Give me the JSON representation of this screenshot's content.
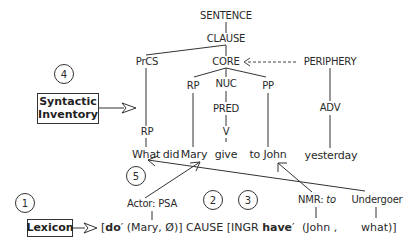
{
  "tree": {
    "sentence": "SENTENCE",
    "clause": "CLAUSE",
    "prcs": "PrCS",
    "core": "CORE",
    "periphery": "PERIPHERY",
    "core_rp": "RP",
    "nuc": "NUC",
    "pp": "PP",
    "pred": "PRED",
    "adv": "ADV",
    "prcs_rp": "RP",
    "v": "V"
  },
  "sentence_words": {
    "what": "What",
    "did": "did",
    "mary": "Mary",
    "give": "give",
    "to_john": "to John",
    "yesterday": "yesterday"
  },
  "steps": {
    "one": "1",
    "two": "2",
    "three": "3",
    "four": "4",
    "five": "5"
  },
  "boxes": {
    "syntactic_inventory_line1": "Syntactic",
    "syntactic_inventory_line2": "Inventory",
    "lexicon": "Lexicon"
  },
  "roles": {
    "actor": "Actor: PSA",
    "nmr_prefix": "NMR: ",
    "nmr_italic": "to",
    "undergoer": "Undergoer"
  },
  "logical_structure": {
    "open_bracket": "[",
    "do": "do",
    "prime1": "′ (Mary, Ø)] CAUSE [INGR ",
    "have": "have",
    "prime2": "′",
    "john": "(John ,",
    "what": "what)]"
  },
  "colors": {
    "line": "#333333",
    "text": "#2a2a2a",
    "background": "#ffffff"
  }
}
